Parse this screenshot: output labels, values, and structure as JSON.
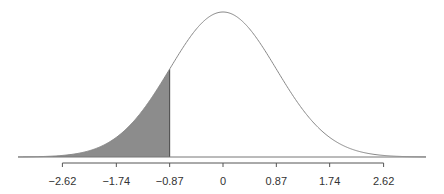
{
  "chart_data": {
    "type": "area",
    "title": "",
    "xlabel": "",
    "ylabel": "",
    "distribution": "normal",
    "mean": 0,
    "sd": 0.87,
    "shaded_region": {
      "from": "-inf",
      "to": -0.87,
      "side": "lower tail"
    },
    "x_ticks": [
      -2.62,
      -1.74,
      -0.87,
      0,
      0.87,
      1.74,
      2.62
    ],
    "tick_labels": [
      "−2.62",
      "−1.74",
      "−0.87",
      "0",
      "0.87",
      "1.74",
      "2.62"
    ],
    "xlim": [
      -3.0,
      3.0
    ],
    "grid": false,
    "legend": null,
    "colors": {
      "curve": "#888888",
      "shade": "#8c8c8c",
      "axis": "#555555",
      "baseline": "#777777"
    }
  }
}
